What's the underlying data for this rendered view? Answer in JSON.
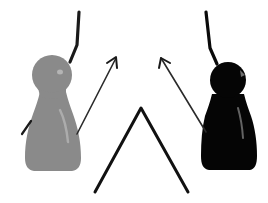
{
  "scene": {
    "width": 268,
    "height": 203,
    "background": "#ffffff",
    "description": "Gray pawn and black pawn facing each other with arrows pointing toward a central caret"
  },
  "colors": {
    "gray_pawn": "#8a8a8a",
    "gray_pawn_highlight": "#b4b4b4",
    "black_pawn": "#050505",
    "black_pawn_highlight": "#6e6e6e",
    "line": "#1a1a1a"
  },
  "figures": [
    {
      "name": "gray-pawn",
      "color_key": "gray_pawn"
    },
    {
      "name": "black-pawn",
      "color_key": "black_pawn"
    }
  ],
  "symbols": {
    "caret": "^",
    "arrows": 2,
    "antenna_lines": 2
  }
}
